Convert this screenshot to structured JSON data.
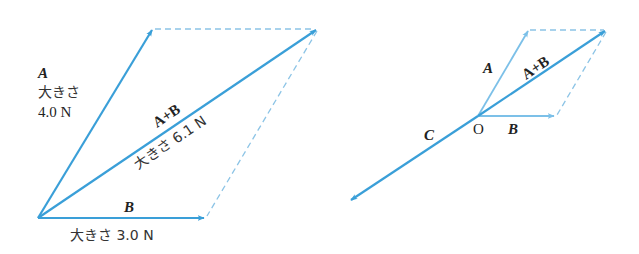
{
  "colors": {
    "vector": "#3a9fd8",
    "vector_light": "#7cc0e8",
    "dashed": "#8cc4e6",
    "text": "#222222"
  },
  "left_diagram": {
    "origin": [
      38,
      218
    ],
    "vectors": {
      "A": {
        "label": "A",
        "magnitude_label": "大きさ",
        "magnitude_value": "4.0 N",
        "tip": [
          153,
          29
        ]
      },
      "B": {
        "label": "B",
        "magnitude_text": "大きさ 3.0 N",
        "tip": [
          205,
          218
        ]
      },
      "sum": {
        "label": "A+B",
        "magnitude_text": "大きさ 6.1 N",
        "tip": [
          317,
          29
        ]
      }
    }
  },
  "right_diagram": {
    "origin_label": "O",
    "origin": [
      478,
      116
    ],
    "vectors": {
      "A": {
        "label": "A",
        "tip": [
          529,
          30
        ]
      },
      "B": {
        "label": "B",
        "tip": [
          555,
          116
        ]
      },
      "sum": {
        "label": "A+B",
        "tip": [
          606,
          30
        ]
      },
      "C": {
        "label": "C",
        "tip": [
          350,
          200
        ]
      }
    }
  }
}
